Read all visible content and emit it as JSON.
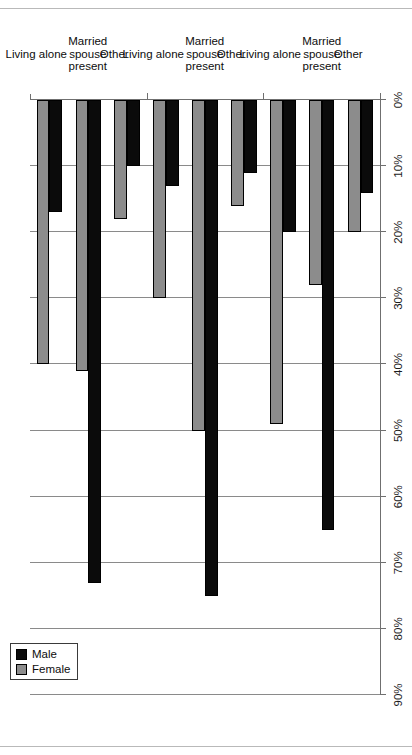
{
  "chart_data": {
    "type": "bar",
    "orientation": "horizontal",
    "title": "",
    "xlabel": "",
    "ylabel": "",
    "xlim": [
      0,
      90
    ],
    "xticks": [
      "0%",
      "10%",
      "20%",
      "30%",
      "40%",
      "50%",
      "60%",
      "70%",
      "80%",
      "90%"
    ],
    "xtick_values": [
      0,
      10,
      20,
      30,
      40,
      50,
      60,
      70,
      80,
      90
    ],
    "grid": true,
    "legend_position": "top-left",
    "legend": [
      "Male",
      "Female"
    ],
    "colors": {
      "male": "#0b0b0b",
      "female": "#8c8c8c",
      "axis": "#6f6f6f",
      "grid": "#8a8a8a",
      "background": "#ffffff"
    },
    "groups": [
      {
        "name": "65 years old and over",
        "categories": [
          "Living alone",
          "Married\nspouse\npresent",
          "Other"
        ],
        "series": [
          {
            "name": "Male",
            "values": [
              17,
              73,
              10
            ]
          },
          {
            "name": "Female",
            "values": [
              40,
              41,
              18
            ]
          }
        ]
      },
      {
        "name": "65 to 74 years old",
        "categories": [
          "Living alone",
          "Married\nspouse\npresent",
          "Other"
        ],
        "series": [
          {
            "name": "Male",
            "values": [
              13,
              75,
              11
            ]
          },
          {
            "name": "Female",
            "values": [
              30,
              50,
              16
            ]
          }
        ]
      },
      {
        "name": "75 years old and over",
        "categories": [
          "Living alone",
          "Married\nspouse\npresent",
          "Other"
        ],
        "series": [
          {
            "name": "Male",
            "values": [
              20,
              65,
              14
            ]
          },
          {
            "name": "Female",
            "values": [
              49,
              28,
              20
            ]
          }
        ]
      }
    ]
  },
  "legend": {
    "male_label": "Male",
    "female_label": "Female"
  },
  "group_labels": [
    "65 years old and over",
    "65 to 74 years old",
    "75 years old and over"
  ]
}
